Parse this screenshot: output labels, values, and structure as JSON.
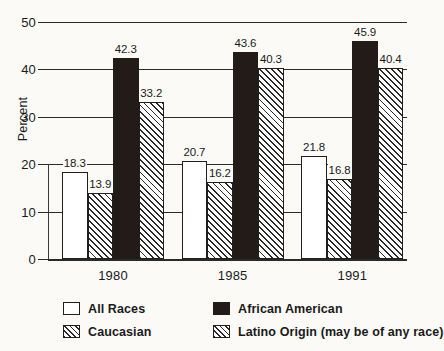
{
  "chart_data": {
    "type": "bar",
    "title": "",
    "xlabel": "",
    "ylabel": "Percent",
    "ylim": [
      0,
      50
    ],
    "yticks": [
      0,
      10,
      20,
      30,
      40,
      50
    ],
    "grid": true,
    "legend_position": "bottom",
    "categories": [
      "1980",
      "1985",
      "1991"
    ],
    "series": [
      {
        "name": "All Races",
        "style": "open",
        "values": [
          18.3,
          20.7,
          21.8
        ]
      },
      {
        "name": "Caucasian",
        "style": "hatch",
        "values": [
          13.9,
          16.2,
          16.8
        ]
      },
      {
        "name": "African American",
        "style": "solid",
        "values": [
          42.3,
          43.6,
          45.9
        ]
      },
      {
        "name": "Latino Origin (may be of any race)",
        "style": "hatch",
        "values": [
          33.2,
          40.3,
          40.4
        ]
      }
    ]
  },
  "axis": {
    "y_title": "Percent",
    "y_tick_labels": [
      "0",
      "10",
      "20",
      "30",
      "40",
      "50"
    ],
    "x_tick_labels": [
      "1980",
      "1985",
      "1991"
    ]
  },
  "legend": {
    "entries": [
      {
        "label": "All Races",
        "style": "open"
      },
      {
        "label": "African American",
        "style": "solid"
      },
      {
        "label": "Caucasian",
        "style": "hatch"
      },
      {
        "label": "Latino Origin (may be of any race)",
        "style": "hatch"
      }
    ]
  },
  "colors": {
    "solid_bar": "#221b17",
    "outline": "#1f1f1f",
    "background": "#fbfaf7",
    "text": "#1a1a1a"
  }
}
